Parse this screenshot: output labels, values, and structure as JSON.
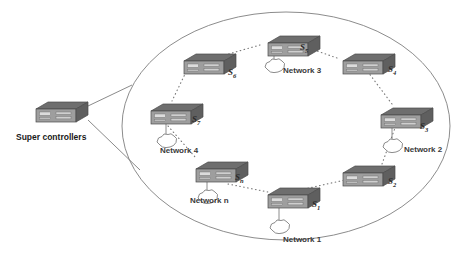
{
  "diagram": {
    "background_color": "#ffffff",
    "outline_color": "#8c8c8c",
    "switch_body_color": "#9a9a9a",
    "switch_top_color": "#6e6e6e",
    "switch_side_color": "#5f5f5f",
    "port_color": "#d8d8d8",
    "link_color": "#7d7d7d",
    "text_color": "#2b2b2b"
  },
  "boundary": {
    "shape": "ellipse",
    "cx": 286,
    "cy": 126,
    "rx": 164,
    "ry": 114
  },
  "controller": {
    "label": "Super controllers",
    "icon": "network-switch-icon",
    "x": 30,
    "y": 100,
    "label_x": 16,
    "label_y": 133
  },
  "connectors": {
    "controller_links": [
      {
        "x1": 88,
        "y1": 106,
        "x2": 131,
        "y2": 85
      },
      {
        "x1": 88,
        "y1": 120,
        "x2": 139,
        "y2": 168
      }
    ],
    "style": "solid"
  },
  "switches": [
    {
      "id": "S1",
      "label": "S",
      "sub": "1",
      "x": 262,
      "y": 186,
      "label_x": 312,
      "label_y": 205,
      "network": {
        "label": "Network 1",
        "cloud_x": 268,
        "cloud_y": 219,
        "label_x": 283,
        "label_y": 239
      }
    },
    {
      "id": "S2",
      "label": "S",
      "sub": "2",
      "x": 337,
      "y": 164,
      "label_x": 388,
      "label_y": 182,
      "network": null
    },
    {
      "id": "S3",
      "label": "S",
      "sub": "3",
      "x": 375,
      "y": 106,
      "label_x": 420,
      "label_y": 127,
      "network": {
        "label": "Network 2",
        "cloud_x": 381,
        "cloud_y": 138,
        "label_x": 404,
        "label_y": 150
      }
    },
    {
      "id": "S4",
      "label": "S",
      "sub": "4",
      "x": 337,
      "y": 52,
      "label_x": 388,
      "label_y": 70,
      "network": null
    },
    {
      "id": "S5",
      "label": "S",
      "sub": "5",
      "x": 262,
      "y": 34,
      "label_x": 300,
      "label_y": 49,
      "network": {
        "label": "Network 3",
        "cloud_x": 263,
        "cloud_y": 58,
        "label_x": 283,
        "label_y": 71
      }
    },
    {
      "id": "S6",
      "label": "S",
      "sub": "6",
      "x": 178,
      "y": 52,
      "label_x": 228,
      "label_y": 73,
      "network": null
    },
    {
      "id": "S7",
      "label": "S",
      "sub": "7",
      "x": 145,
      "y": 102,
      "label_x": 192,
      "label_y": 120,
      "network": {
        "label": "Network 4",
        "cloud_x": 155,
        "cloud_y": 133,
        "label_x": 160,
        "label_y": 151
      }
    },
    {
      "id": "Sn",
      "label": "S",
      "sub": "n",
      "x": 190,
      "y": 160,
      "label_x": 235,
      "label_y": 178,
      "network": {
        "label": "Network n",
        "cloud_x": 196,
        "cloud_y": 189,
        "label_x": 190,
        "label_y": 201
      }
    }
  ],
  "ring_links": [
    {
      "from": "S1",
      "to": "S2",
      "style": "dotted"
    },
    {
      "from": "S2",
      "to": "S3",
      "style": "dotted"
    },
    {
      "from": "S3",
      "to": "S4",
      "style": "dotted"
    },
    {
      "from": "S4",
      "to": "S5",
      "style": "dotted"
    },
    {
      "from": "S5",
      "to": "S6",
      "style": "dotted"
    },
    {
      "from": "S6",
      "to": "S7",
      "style": "dotted"
    },
    {
      "from": "S7",
      "to": "Sn",
      "style": "dotted"
    },
    {
      "from": "Sn",
      "to": "S1",
      "style": "dotted"
    }
  ]
}
